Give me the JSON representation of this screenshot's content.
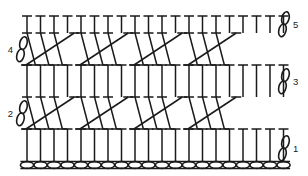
{
  "diagram": {
    "type": "crochet-pattern-chart",
    "background_color": "#ffffff",
    "stroke_color": "#1a1a1a",
    "row_labels": [
      {
        "id": "label-1",
        "text": "1",
        "side": "right",
        "row": 1
      },
      {
        "id": "label-2",
        "text": "2",
        "side": "left",
        "row": 2
      },
      {
        "id": "label-3",
        "text": "3",
        "side": "right",
        "row": 3
      },
      {
        "id": "label-4",
        "text": "4",
        "side": "left",
        "row": 4
      },
      {
        "id": "label-5",
        "text": "5",
        "side": "right",
        "row": 5
      }
    ]
  },
  "chart_data": {
    "type": "diagram",
    "xlabel": "",
    "ylabel": "",
    "legend": [],
    "geometry": {
      "width": 308,
      "height": 176,
      "left_margin": 24,
      "right_margin": 281,
      "stitch_count": 20,
      "stitch_spacing": 13.5,
      "first_stitch_x": 27,
      "bar_half_width": 5.0,
      "stroke_width": 1.5,
      "thin_stroke_width": 1.2
    },
    "foundation_chain": {
      "name": "foundation-chain",
      "symbol": "chain-stitch-oval",
      "count": 20,
      "y": 165,
      "oval_rx": 6.6,
      "oval_ry": 3.4,
      "x_start": 27,
      "x_step": 13.5
    },
    "rows": [
      {
        "number": 1,
        "name": "row-1-plain",
        "kind": "plain",
        "stitch_symbol": "double-crochet-T",
        "stitch_count": 20,
        "top_y": 129,
        "bottom_y": 161,
        "label": "1",
        "label_side": "right"
      },
      {
        "number": 2,
        "name": "row-2-crossed",
        "kind": "crossed",
        "stitch_symbol": "crossed-double-crochet",
        "repeat_groups": 4,
        "stitches_per_group": 4,
        "stitch_count": 20,
        "top_y": 97,
        "bottom_y": 129,
        "label": "2",
        "label_side": "left"
      },
      {
        "number": 3,
        "name": "row-3-plain",
        "kind": "plain",
        "stitch_symbol": "double-crochet-T",
        "stitch_count": 20,
        "top_y": 65,
        "bottom_y": 97,
        "label": "3",
        "label_side": "right"
      },
      {
        "number": 4,
        "name": "row-4-crossed",
        "kind": "crossed",
        "stitch_symbol": "crossed-double-crochet",
        "repeat_groups": 4,
        "stitches_per_group": 4,
        "stitch_count": 20,
        "top_y": 33,
        "bottom_y": 65,
        "label": "4",
        "label_side": "left"
      },
      {
        "number": 5,
        "name": "row-5-plain",
        "kind": "plain",
        "stitch_symbol": "double-crochet-T",
        "stitch_count": 20,
        "top_y": 16,
        "bottom_y": 33,
        "label": "5",
        "label_side": "right"
      }
    ],
    "turning_chains": [
      {
        "name": "turning-chain-1",
        "side": "right",
        "x": 284,
        "y": 148,
        "label": "1"
      },
      {
        "name": "turning-chain-2",
        "side": "left",
        "x": 22,
        "y": 113,
        "label": "2"
      },
      {
        "name": "turning-chain-3",
        "side": "right",
        "x": 284,
        "y": 81,
        "label": "3"
      },
      {
        "name": "turning-chain-4",
        "side": "left",
        "x": 22,
        "y": 49,
        "label": "4"
      },
      {
        "name": "turning-chain-5",
        "side": "right",
        "x": 284,
        "y": 24,
        "label": "5"
      }
    ]
  }
}
